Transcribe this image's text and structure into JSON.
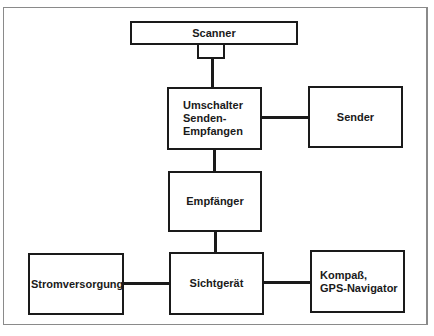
{
  "diagram": {
    "type": "block-diagram",
    "nodes": [
      {
        "id": "scanner",
        "label": "Scanner"
      },
      {
        "id": "umschalter",
        "label": "Umschalter\nSenden-\nEmpfangen"
      },
      {
        "id": "sender",
        "label": "Sender"
      },
      {
        "id": "empfaenger",
        "label": "Empfänger"
      },
      {
        "id": "sichtgeraet",
        "label": "Sichtgerät"
      },
      {
        "id": "stromversorgung",
        "label": "Stromversorgung"
      },
      {
        "id": "kompass",
        "label": "Kompaß,\nGPS-Navigator"
      }
    ],
    "edges": [
      {
        "from": "scanner",
        "to": "umschalter"
      },
      {
        "from": "umschalter",
        "to": "sender"
      },
      {
        "from": "umschalter",
        "to": "empfaenger"
      },
      {
        "from": "empfaenger",
        "to": "sichtgeraet"
      },
      {
        "from": "stromversorgung",
        "to": "sichtgeraet"
      },
      {
        "from": "sichtgeraet",
        "to": "kompass"
      }
    ],
    "colors": {
      "line": "#1a1a1a",
      "background": "#ffffff",
      "frame": "#8a8a8a"
    }
  }
}
